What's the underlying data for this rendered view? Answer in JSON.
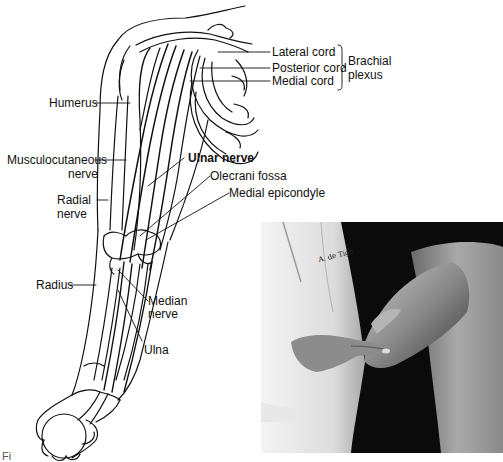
{
  "figure": {
    "illustration": {
      "subject": "Anterior view of right upper limb showing brachial plexus and nerves",
      "labels": {
        "lateral_cord": "Lateral cord",
        "posterior_cord": "Posterior cord",
        "medial_cord": "Medial cord",
        "brachial_plexus_line1": "Brachial",
        "brachial_plexus_line2": "plexus",
        "humerus": "Humerus",
        "musculocutaneous_line1": "Musculocutaneous",
        "musculocutaneous_line2": "nerve",
        "ulnar_nerve": "Ulnar nerve",
        "olecrani_fossa": "Olecrani fossa",
        "medial_epicondyle": "Medial epicondyle",
        "radial_line1": "Radial",
        "radial_line2": "nerve",
        "radius": "Radius",
        "median_line1": "Median",
        "median_line2": "nerve",
        "ulna": "Ulna"
      }
    },
    "photo": {
      "subject": "Examiner palpating ulnar nerve at the medial elbow of a patient",
      "coat_monogram": "A. de Tigo"
    },
    "cutoff_caption": "Fi"
  }
}
